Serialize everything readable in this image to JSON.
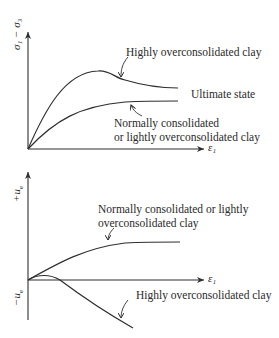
{
  "top_panel": {
    "y_axis_label": "σ₁ − σ₃",
    "x_axis_label": "ε₁",
    "curves": [
      {
        "name": "highly-overconsolidated",
        "label": "Highly overconsolidated clay",
        "shape": "rises to peak then softens to ultimate"
      },
      {
        "name": "normally-consolidated",
        "label_line1": "Normally consolidated",
        "label_line2": "or lightly overconsolidated clay",
        "shape": "monotonic rise to plateau"
      }
    ],
    "ultimate_state_label": "Ultimate state"
  },
  "bottom_panel": {
    "y_axis_pos_label": "+u",
    "y_axis_neg_label": "−u",
    "y_axis_sub": "e",
    "x_axis_label": "ε₁",
    "curves": [
      {
        "name": "normally-consolidated",
        "label_line1": "Normally consolidated or lightly",
        "label_line2": "overconsolidated clay",
        "shape": "positive excess pore pressure rising to plateau"
      },
      {
        "name": "highly-overconsolidated",
        "label": "Highly overconsolidated clay",
        "shape": "slightly positive then strongly negative"
      }
    ]
  },
  "colors": {
    "line": "#2e2e2e",
    "text": "#2a2a2a",
    "background": "#ffffff"
  }
}
